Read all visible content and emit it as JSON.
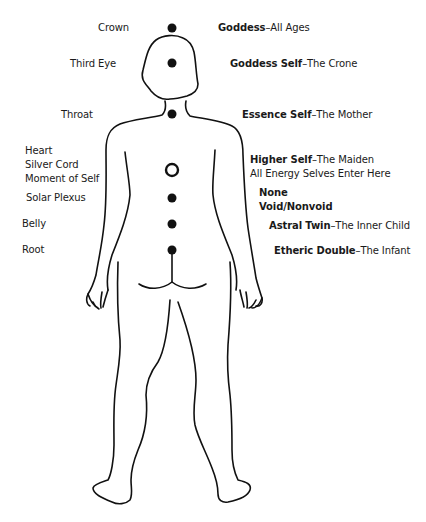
{
  "diagram": {
    "type": "body-energy-centers",
    "view": "back view of human figure"
  },
  "left_labels": [
    {
      "id": "crown",
      "text": "Crown"
    },
    {
      "id": "third-eye",
      "text": "Third Eye"
    },
    {
      "id": "throat",
      "text": "Throat"
    },
    {
      "id": "heart",
      "lines": [
        "Heart",
        "Silver Cord",
        "Moment of Self"
      ]
    },
    {
      "id": "solar-plexus",
      "text": "Solar Plexus"
    },
    {
      "id": "belly",
      "text": "Belly"
    },
    {
      "id": "root",
      "text": "Root"
    }
  ],
  "right_labels": [
    {
      "id": "crown",
      "bold": "Goddess",
      "rest": "–All Ages"
    },
    {
      "id": "third-eye",
      "bold": "Goddess Self",
      "rest": "–The Crone"
    },
    {
      "id": "throat",
      "bold": "Essence Self",
      "rest": "–The Mother"
    },
    {
      "id": "heart",
      "bold": "Higher Self",
      "rest": "–The Maiden",
      "line2": "All Energy Selves Enter Here"
    },
    {
      "id": "solar-plexus",
      "bold_lines": [
        "None",
        "Void/Nonvoid"
      ]
    },
    {
      "id": "belly",
      "bold": "Astral Twin",
      "rest": "–The Inner Child"
    },
    {
      "id": "root",
      "bold": "Etheric Double",
      "rest": "–The Infant"
    }
  ],
  "centers": [
    {
      "id": "crown",
      "style": "filled"
    },
    {
      "id": "third-eye",
      "style": "filled"
    },
    {
      "id": "throat",
      "style": "filled"
    },
    {
      "id": "heart",
      "style": "ring"
    },
    {
      "id": "solar-plexus",
      "style": "filled"
    },
    {
      "id": "belly",
      "style": "filled"
    },
    {
      "id": "root",
      "style": "filled"
    }
  ],
  "colors": {
    "ink": "#111111",
    "background": "#ffffff"
  }
}
